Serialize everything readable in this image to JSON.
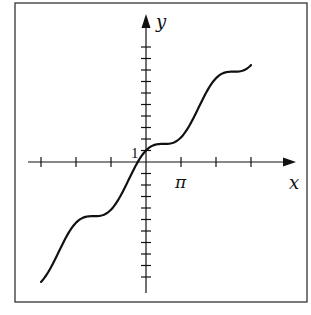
{
  "chart_data": {
    "type": "line",
    "title": "",
    "function": "y = x + cos(x)",
    "xlabel": "x",
    "ylabel": "y",
    "x_tick_labels": [
      {
        "value": 3.14159,
        "label": "π"
      }
    ],
    "y_tick_labels": [
      {
        "value": 1,
        "label": "1"
      }
    ],
    "x_ticks": [
      -9.4248,
      -6.2832,
      -3.1416,
      3.1416,
      6.2832,
      9.4248
    ],
    "y_ticks": [
      -10,
      -9,
      -8,
      -7,
      -6,
      -5,
      -4,
      -3,
      -2,
      -1,
      1,
      2,
      3,
      4,
      5,
      6,
      7,
      8,
      9,
      10
    ],
    "xlim": [
      -10.8,
      10.2
    ],
    "ylim": [
      -11.5,
      12.5
    ],
    "grid": false,
    "legend": null,
    "series": [
      {
        "name": "f(x) = x + cos x",
        "x": [
          -9.4248,
          -7.854,
          -6.2832,
          -4.7124,
          -3.1416,
          -1.5708,
          0,
          1.5708,
          3.1416,
          4.7124,
          6.2832,
          7.854,
          9.4248
        ],
        "values": [
          -10.4248,
          -7.854,
          -5.2832,
          -4.7124,
          -4.1416,
          -1.5708,
          1,
          1.5708,
          2.1416,
          4.7124,
          7.2832,
          7.854,
          8.4248
        ]
      }
    ]
  },
  "labels": {
    "x_axis": "x",
    "y_axis": "y",
    "one": "1",
    "pi": "π"
  },
  "colors": {
    "ink": "#111111",
    "frame": "#333333",
    "background": "#ffffff"
  }
}
